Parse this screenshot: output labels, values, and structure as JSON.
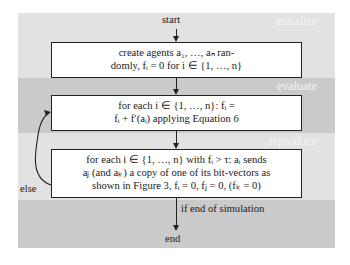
{
  "bands": [
    {
      "name": "initialize",
      "label": "initialize",
      "color": "#e2e2e2"
    },
    {
      "name": "evaluate",
      "label": "evaluate",
      "color": "#cacaca"
    },
    {
      "name": "reproduce",
      "label": "reproduce",
      "color": "#e2e2e2"
    },
    {
      "name": "end",
      "label": "",
      "color": "#cacaca"
    }
  ],
  "nodes": {
    "start": "start",
    "end": "end",
    "box1": {
      "line1": "create agents a₁, …, aₙ ran-",
      "line2": "domly, fᵢ = 0 for i ∈ {1, …, n}"
    },
    "box2": {
      "line1": "for each i  ∈  {1, …, n}: fᵢ  =",
      "line2": "fᵢ + f′(aᵢ) applying Equation 6"
    },
    "box3": {
      "line1": "for each i ∈ {1, …, n} with fᵢ > τ: aᵢ sends",
      "line2": "aⱼ (and aₖ) a copy of one of its bit-vectors as",
      "line3": "shown in Figure 3, fᵢ = 0, fⱼ = 0, (fₖ = 0)"
    }
  },
  "edges": {
    "else_label": "else",
    "end_condition": "if end of simulation"
  }
}
